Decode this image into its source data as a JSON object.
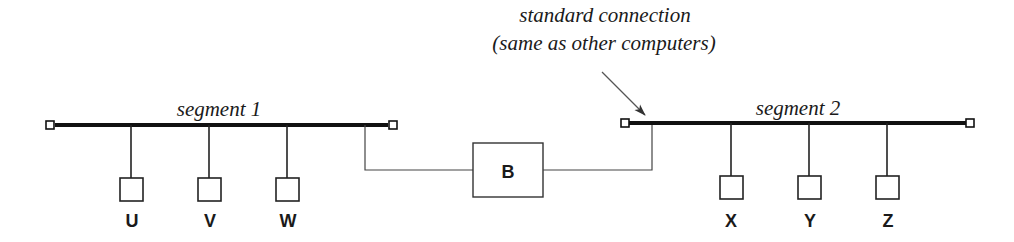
{
  "annotation": {
    "line1": "standard connection",
    "line2": "(same as other computers)"
  },
  "segments": [
    {
      "label": "segment 1",
      "computers": [
        "U",
        "V",
        "W"
      ]
    },
    {
      "label": "segment 2",
      "computers": [
        "X",
        "Y",
        "Z"
      ]
    }
  ],
  "bridge": {
    "label": "B"
  },
  "colors": {
    "line": "#111111",
    "background": "#ffffff"
  }
}
